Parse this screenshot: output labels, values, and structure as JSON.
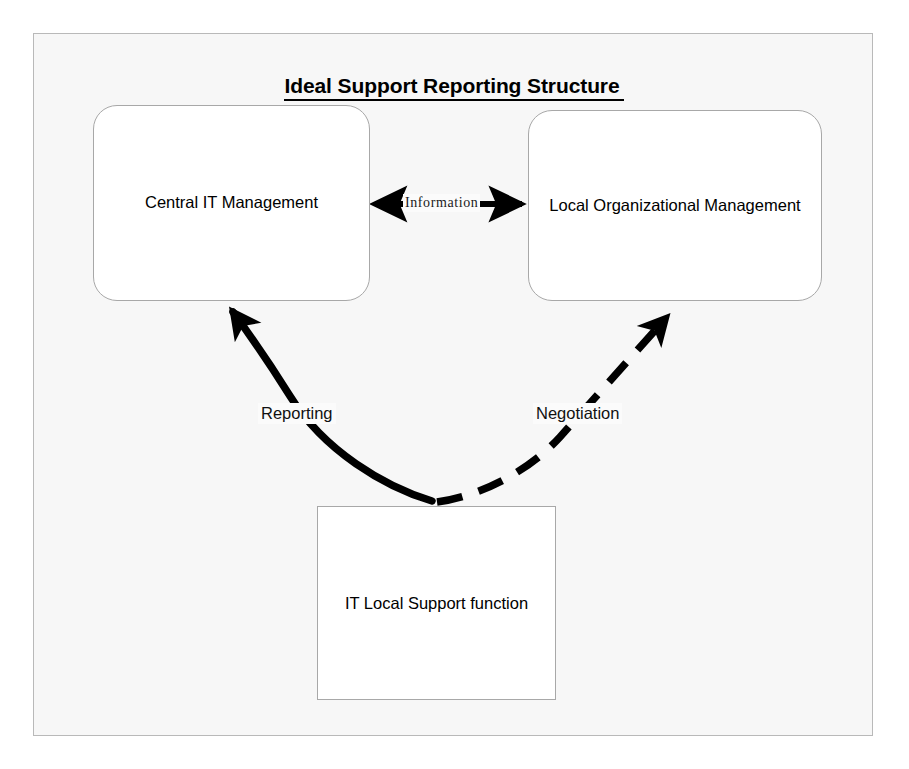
{
  "diagram": {
    "title": "Ideal Support Reporting Structure",
    "background_color": "#f7f7f7",
    "frame_border_color": "#b9b9b9",
    "node_border_color": "#a8a8a8",
    "connector_color": "#000000",
    "nodes": [
      {
        "id": "central-it",
        "label": "Central IT Management",
        "shape": "rounded-rectangle"
      },
      {
        "id": "local-org",
        "label": "Local Organizational Management",
        "shape": "rounded-rectangle"
      },
      {
        "id": "it-support",
        "label": "IT Local Support function",
        "shape": "rectangle"
      }
    ],
    "connectors": [
      {
        "id": "information",
        "label": "Information",
        "from": "central-it",
        "to": "local-org",
        "style": "solid-straight",
        "arrowheads": "both"
      },
      {
        "id": "reporting",
        "label": "Reporting",
        "from": "it-support",
        "to": "central-it",
        "style": "solid-curved",
        "arrowheads": "end"
      },
      {
        "id": "negotiation",
        "label": "Negotiation",
        "from": "it-support",
        "to": "local-org",
        "style": "dashed-curved",
        "arrowheads": "end"
      }
    ]
  }
}
